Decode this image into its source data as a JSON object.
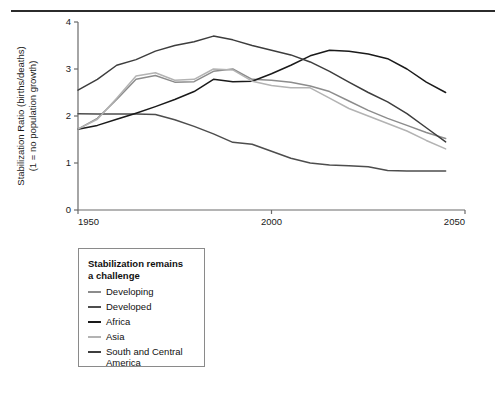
{
  "figure": {
    "top_rule": "horizontal-rule"
  },
  "legend": {
    "title": "Stabilization remains\na challenge",
    "items": [
      {
        "label": "Developing",
        "color": "#8c8c8c"
      },
      {
        "label": "Developed",
        "color": "#4d4d4d"
      },
      {
        "label": "Africa",
        "color": "#1a1a1a"
      },
      {
        "label": "Asia",
        "color": "#b3b3b3"
      },
      {
        "label": "South and Central America",
        "color": "#3d3d3d"
      }
    ]
  },
  "chart_data": {
    "type": "line",
    "title": "",
    "xlabel": "",
    "ylabel": "Stabilization Ratio (births/deaths)\n(1 = no population growth)",
    "ylabel_line1": "Stabilization Ratio (births/deaths)",
    "ylabel_line2": "(1 = no population growth)",
    "xlim": [
      1950,
      2050
    ],
    "ylim": [
      0,
      4
    ],
    "xticks": [
      1950,
      2000,
      2050
    ],
    "xtick_labels": [
      "1950",
      "2000",
      "2050"
    ],
    "yticks": [
      0,
      1,
      2,
      3,
      4
    ],
    "ytick_labels": [
      "0",
      "1",
      "2",
      "3",
      "4"
    ],
    "grid": false,
    "legend_position": "below-left",
    "x": [
      1950,
      1955,
      1960,
      1965,
      1970,
      1975,
      1980,
      1985,
      1990,
      1995,
      2000,
      2005,
      2010,
      2015,
      2020,
      2025,
      2030,
      2035,
      2040,
      2045
    ],
    "series": [
      {
        "name": "Developing",
        "color": "#8c8c8c",
        "values": [
          1.72,
          1.95,
          2.35,
          2.78,
          2.86,
          2.72,
          2.73,
          2.95,
          3.0,
          2.78,
          2.76,
          2.72,
          2.64,
          2.52,
          2.32,
          2.12,
          1.95,
          1.8,
          1.65,
          1.52
        ]
      },
      {
        "name": "Developed",
        "color": "#4d4d4d",
        "values": [
          2.05,
          2.04,
          2.04,
          2.04,
          2.03,
          1.92,
          1.78,
          1.62,
          1.44,
          1.4,
          1.25,
          1.1,
          1.0,
          0.96,
          0.94,
          0.92,
          0.84,
          0.83,
          0.83,
          0.83
        ]
      },
      {
        "name": "Africa",
        "color": "#1a1a1a",
        "values": [
          1.72,
          1.8,
          1.93,
          2.06,
          2.2,
          2.35,
          2.52,
          2.78,
          2.73,
          2.74,
          2.9,
          3.08,
          3.28,
          3.4,
          3.38,
          3.32,
          3.22,
          3.0,
          2.72,
          2.5
        ]
      },
      {
        "name": "Asia",
        "color": "#b3b3b3",
        "values": [
          1.72,
          1.93,
          2.38,
          2.85,
          2.92,
          2.76,
          2.78,
          3.0,
          2.98,
          2.74,
          2.65,
          2.6,
          2.6,
          2.38,
          2.16,
          2.0,
          1.84,
          1.68,
          1.48,
          1.3
        ]
      },
      {
        "name": "South and Central America",
        "color": "#3d3d3d",
        "values": [
          2.55,
          2.78,
          3.08,
          3.2,
          3.38,
          3.5,
          3.58,
          3.7,
          3.62,
          3.5,
          3.4,
          3.3,
          3.15,
          2.95,
          2.72,
          2.5,
          2.3,
          2.05,
          1.75,
          1.45
        ]
      }
    ]
  }
}
